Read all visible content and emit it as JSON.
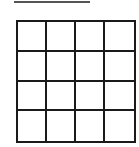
{
  "answer_line": {
    "text": "",
    "color": "#555555"
  },
  "grid": {
    "rows": 4,
    "cols": 4,
    "line_color": "#1a1a1a",
    "cells": [
      [
        "",
        "",
        "",
        ""
      ],
      [
        "",
        "",
        "",
        ""
      ],
      [
        "",
        "",
        "",
        ""
      ],
      [
        "",
        "",
        "",
        ""
      ]
    ]
  }
}
